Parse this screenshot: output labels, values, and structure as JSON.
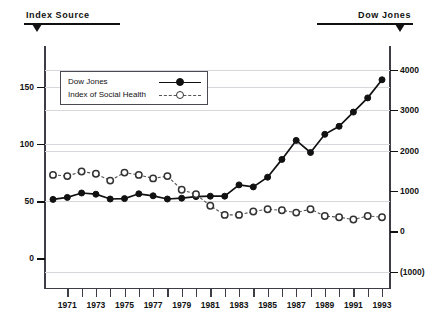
{
  "header": {
    "left_label": "Index Source",
    "right_label": "Dow Jones"
  },
  "legend": {
    "items": [
      {
        "label": "Dow Jones",
        "marker": "filled-circle",
        "line": "solid",
        "color": "#111111"
      },
      {
        "label": "Index of Social Health",
        "marker": "open-circle",
        "line": "dashed",
        "color": "#555555"
      }
    ]
  },
  "chart_data": {
    "type": "line",
    "title": "",
    "xlabel": "",
    "ylabel": "",
    "grid": true,
    "legend_position": "top-left-inside",
    "x": [
      1970,
      1971,
      1972,
      1973,
      1974,
      1975,
      1976,
      1977,
      1978,
      1979,
      1980,
      1981,
      1982,
      1983,
      1984,
      1985,
      1986,
      1987,
      1988,
      1989,
      1990,
      1991,
      1992,
      1993
    ],
    "xtick_labels": [
      "1971",
      "1973",
      "1975",
      "1977",
      "1979",
      "1981",
      "1983",
      "1985",
      "1987",
      "1989",
      "1991",
      "1993"
    ],
    "xtick_values": [
      1971,
      1973,
      1975,
      1977,
      1979,
      1981,
      1983,
      1985,
      1987,
      1989,
      1991,
      1993
    ],
    "left_axis": {
      "name": "Index of Social Health",
      "ticks": [
        0,
        50,
        100,
        150
      ],
      "tick_labels": [
        "0",
        "50",
        "100",
        "150"
      ],
      "ylim": [
        -26,
        185
      ]
    },
    "right_axis": {
      "name": "Dow Jones",
      "ticks": [
        -1000,
        0,
        1000,
        2000,
        3000,
        4000
      ],
      "tick_labels": [
        "(1000)",
        "0",
        "1000",
        "2000",
        "3000",
        "4000"
      ],
      "ylim": [
        -1400,
        4560
      ]
    },
    "series": [
      {
        "name": "Dow Jones",
        "axis": "right",
        "marker": "filled-circle",
        "line": "solid",
        "color": "#111111",
        "values": [
          790,
          840,
          950,
          920,
          800,
          810,
          930,
          880,
          800,
          820,
          860,
          870,
          870,
          1150,
          1100,
          1340,
          1780,
          2250,
          1950,
          2400,
          2600,
          2950,
          3300,
          3750
        ]
      },
      {
        "name": "Index of Social Health",
        "axis": "left",
        "marker": "open-circle",
        "line": "dashed",
        "color": "#555555",
        "values": [
          73,
          72,
          76,
          74,
          68,
          75,
          73,
          70,
          72,
          60,
          56,
          46,
          38,
          38,
          41,
          43,
          42,
          40,
          43,
          37,
          36,
          34,
          37,
          36
        ]
      }
    ]
  }
}
